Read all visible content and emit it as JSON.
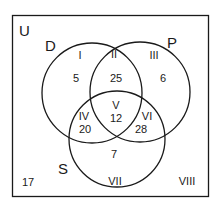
{
  "universe_label": "U",
  "sets": {
    "D": {
      "label": "D",
      "cx": 92,
      "cy": 93,
      "r": 50
    },
    "P": {
      "label": "P",
      "cx": 140,
      "cy": 92,
      "r": 50
    },
    "S": {
      "label": "S",
      "cx": 117,
      "cy": 139,
      "r": 48
    }
  },
  "regions": [
    {
      "id": "I",
      "roman": "I",
      "value": "5",
      "description": "D only"
    },
    {
      "id": "II",
      "roman": "II",
      "value": "25",
      "description": "D and P only"
    },
    {
      "id": "III",
      "roman": "III",
      "value": "6",
      "description": "P only"
    },
    {
      "id": "IV",
      "roman": "IV",
      "value": "20",
      "description": "D and S only"
    },
    {
      "id": "V",
      "roman": "V",
      "value": "12",
      "description": "D, P and S"
    },
    {
      "id": "VI",
      "roman": "VI",
      "value": "28",
      "description": "P and S only"
    },
    {
      "id": "VII",
      "roman": "VII",
      "value": "7",
      "description": "S only"
    },
    {
      "id": "VIII",
      "roman": "VIII",
      "value": "17",
      "description": "outside all sets"
    }
  ],
  "colors": {
    "line": "#1a1a1a",
    "background": "#ffffff"
  }
}
